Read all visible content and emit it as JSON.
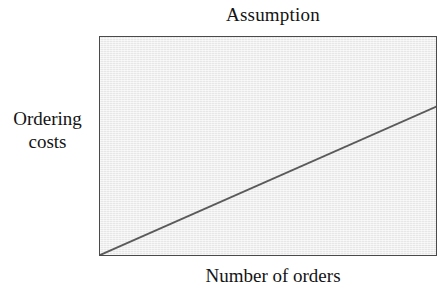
{
  "chart_data": {
    "type": "line",
    "title": "Assumption",
    "xlabel": "Number of orders",
    "ylabel_lines": [
      "Ordering",
      "costs"
    ],
    "ylabel": "Ordering costs",
    "series": [
      {
        "name": "Ordering costs",
        "x": [
          0,
          100
        ],
        "y": [
          0,
          68
        ],
        "color": "#5a5a5a",
        "line_width": 2
      }
    ],
    "xlim": [
      0,
      100
    ],
    "ylim": [
      0,
      100
    ],
    "x_ticks": [],
    "y_ticks": [],
    "x_tick_labels": [],
    "y_tick_labels": [],
    "grid": false,
    "legend": false,
    "legend_position": "none",
    "annotations": [],
    "plot_background_color": "#ededed",
    "frame_color": "#4a4a4a",
    "page_background_color": "#ffffff"
  }
}
